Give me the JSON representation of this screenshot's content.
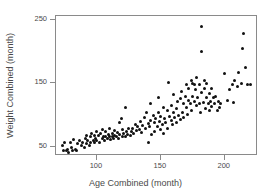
{
  "chart_data": {
    "type": "scatter",
    "title": "",
    "xlabel": "Age Combined (month)",
    "ylabel": "Weight Combined (month)",
    "xlim": [
      68,
      226
    ],
    "ylim": [
      36,
      256
    ],
    "xticks": [
      100,
      150,
      200
    ],
    "xtick_labels": [
      "100",
      "150",
      "200"
    ],
    "yticks": [
      50,
      150,
      250
    ],
    "ytick_labels": [
      "50",
      "150",
      "250"
    ],
    "grid": false,
    "legend": null,
    "marker": "circle",
    "marker_color": "#111111",
    "marker_size_px": 3,
    "frame_color": "#8a8a8a",
    "background": "#ffffff",
    "n_points": 170,
    "points": [
      [
        73,
        53
      ],
      [
        74,
        45
      ],
      [
        75,
        58
      ],
      [
        76,
        44
      ],
      [
        77,
        47
      ],
      [
        78,
        42
      ],
      [
        79,
        57
      ],
      [
        80,
        50
      ],
      [
        81,
        45
      ],
      [
        82,
        62
      ],
      [
        83,
        47
      ],
      [
        84,
        44
      ],
      [
        85,
        55
      ],
      [
        86,
        60
      ],
      [
        88,
        52
      ],
      [
        89,
        58
      ],
      [
        90,
        50
      ],
      [
        91,
        63
      ],
      [
        92,
        56
      ],
      [
        92,
        68
      ],
      [
        93,
        60
      ],
      [
        94,
        53
      ],
      [
        95,
        66
      ],
      [
        95,
        58
      ],
      [
        96,
        72
      ],
      [
        97,
        61
      ],
      [
        98,
        57
      ],
      [
        98,
        69
      ],
      [
        99,
        64
      ],
      [
        100,
        75
      ],
      [
        100,
        60
      ],
      [
        101,
        68
      ],
      [
        102,
        57
      ],
      [
        103,
        71
      ],
      [
        104,
        63
      ],
      [
        104,
        78
      ],
      [
        105,
        66
      ],
      [
        106,
        60
      ],
      [
        107,
        74
      ],
      [
        107,
        67
      ],
      [
        108,
        63
      ],
      [
        109,
        70
      ],
      [
        110,
        66
      ],
      [
        110,
        80
      ],
      [
        111,
        62
      ],
      [
        112,
        72
      ],
      [
        112,
        67
      ],
      [
        113,
        64
      ],
      [
        114,
        76
      ],
      [
        114,
        69
      ],
      [
        115,
        66
      ],
      [
        116,
        73
      ],
      [
        117,
        63
      ],
      [
        118,
        70
      ],
      [
        118,
        88
      ],
      [
        119,
        95
      ],
      [
        120,
        67
      ],
      [
        120,
        78
      ],
      [
        121,
        72
      ],
      [
        122,
        112
      ],
      [
        122,
        66
      ],
      [
        123,
        75
      ],
      [
        124,
        70
      ],
      [
        125,
        80
      ],
      [
        126,
        68
      ],
      [
        127,
        74
      ],
      [
        128,
        79
      ],
      [
        129,
        72
      ],
      [
        130,
        85
      ],
      [
        131,
        76
      ],
      [
        132,
        82
      ],
      [
        133,
        78
      ],
      [
        134,
        90
      ],
      [
        135,
        73
      ],
      [
        136,
        84
      ],
      [
        137,
        96
      ],
      [
        138,
        80
      ],
      [
        139,
        104
      ],
      [
        140,
        87
      ],
      [
        140,
        58
      ],
      [
        141,
        82
      ],
      [
        142,
        118
      ],
      [
        142,
        92
      ],
      [
        143,
        70
      ],
      [
        144,
        100
      ],
      [
        145,
        88
      ],
      [
        145,
        74
      ],
      [
        146,
        95
      ],
      [
        147,
        82
      ],
      [
        148,
        105
      ],
      [
        148,
        128
      ],
      [
        149,
        90
      ],
      [
        150,
        78
      ],
      [
        150,
        98
      ],
      [
        151,
        85
      ],
      [
        152,
        112
      ],
      [
        152,
        72
      ],
      [
        153,
        95
      ],
      [
        154,
        88
      ],
      [
        155,
        108
      ],
      [
        155,
        80
      ],
      [
        156,
        152
      ],
      [
        157,
        98
      ],
      [
        158,
        92
      ],
      [
        158,
        115
      ],
      [
        159,
        85
      ],
      [
        160,
        104
      ],
      [
        160,
        132
      ],
      [
        161,
        96
      ],
      [
        162,
        110
      ],
      [
        162,
        88
      ],
      [
        163,
        122
      ],
      [
        164,
        100
      ],
      [
        165,
        94
      ],
      [
        165,
        126
      ],
      [
        166,
        138
      ],
      [
        167,
        105
      ],
      [
        168,
        118
      ],
      [
        168,
        97
      ],
      [
        169,
        130
      ],
      [
        170,
        112
      ],
      [
        170,
        148
      ],
      [
        171,
        102
      ],
      [
        172,
        124
      ],
      [
        172,
        142
      ],
      [
        173,
        118
      ],
      [
        174,
        108
      ],
      [
        174,
        155
      ],
      [
        175,
        150
      ],
      [
        175,
        130
      ],
      [
        176,
        148
      ],
      [
        176,
        122
      ],
      [
        177,
        140
      ],
      [
        178,
        115
      ],
      [
        178,
        160
      ],
      [
        179,
        128
      ],
      [
        180,
        148
      ],
      [
        180,
        118
      ],
      [
        181,
        104
      ],
      [
        182,
        240
      ],
      [
        182,
        200
      ],
      [
        182,
        136
      ],
      [
        183,
        120
      ],
      [
        184,
        155
      ],
      [
        184,
        142
      ],
      [
        185,
        110
      ],
      [
        186,
        128
      ],
      [
        186,
        150
      ],
      [
        187,
        118
      ],
      [
        188,
        135
      ],
      [
        188,
        108
      ],
      [
        189,
        122
      ],
      [
        190,
        142
      ],
      [
        190,
        114
      ],
      [
        191,
        128
      ],
      [
        192,
        118
      ],
      [
        193,
        130
      ],
      [
        194,
        108
      ],
      [
        195,
        122
      ],
      [
        196,
        112
      ],
      [
        197,
        118
      ],
      [
        200,
        165
      ],
      [
        202,
        124
      ],
      [
        204,
        140
      ],
      [
        206,
        148
      ],
      [
        207,
        120
      ],
      [
        208,
        155
      ],
      [
        210,
        145
      ],
      [
        211,
        168
      ],
      [
        213,
        150
      ],
      [
        214,
        205
      ],
      [
        215,
        228
      ],
      [
        216,
        175
      ],
      [
        218,
        148
      ],
      [
        220,
        148
      ]
    ]
  }
}
